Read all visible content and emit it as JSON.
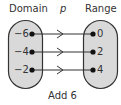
{
  "diagram": {
    "domain_label": "Domain",
    "function_label": "p",
    "range_label": "Range",
    "rule_label": "Add 6",
    "domain_values": [
      "−6",
      "−4",
      "−2"
    ],
    "range_values": [
      "0",
      "2",
      "4"
    ],
    "mappings": [
      {
        "from": "−6",
        "to": "0"
      },
      {
        "from": "−4",
        "to": "2"
      },
      {
        "from": "−2",
        "to": "4"
      }
    ],
    "colors": {
      "oval_fill": "#d9d9d9",
      "stroke": "#333333",
      "text": "#333333"
    }
  }
}
